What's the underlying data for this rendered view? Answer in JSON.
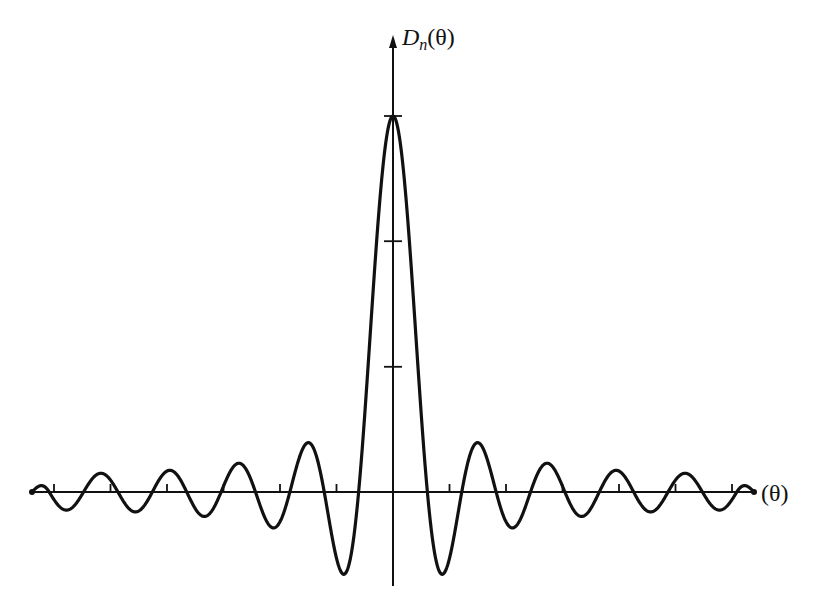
{
  "chart_data": {
    "type": "line",
    "title": "",
    "function": "D_n(theta) = sin((n + 1/2) theta) / sin(theta / 2)",
    "n": 10,
    "peak_value": 21,
    "xlabel": "(θ)",
    "ylabel": "D_n(θ)",
    "ylabel_parts": {
      "base": "D",
      "sub": "n",
      "arg": "(θ)"
    },
    "xlim": [
      -3.14159,
      3.14159
    ],
    "ylim": [
      -4.6,
      21
    ],
    "x_ticks_count_each_side": 6,
    "y_ticks_fraction_of_peak": [
      0.333,
      0.667,
      1.0
    ],
    "grid": false,
    "legend": null,
    "features": {
      "main_lobe_zeros": [
        -0.299,
        0.299
      ],
      "zero_spacing": 0.299,
      "extrema": [
        {
          "label": "central peak",
          "x": 0.0,
          "y": 21.0
        },
        {
          "label": "first min (right)",
          "x": 0.43,
          "y": -4.58
        },
        {
          "label": "first min (left)",
          "x": -0.43,
          "y": -4.58
        },
        {
          "label": "second max (right)",
          "x": 0.74,
          "y": 2.79
        },
        {
          "label": "second max (left)",
          "x": -0.74,
          "y": 2.79
        },
        {
          "label": "second min (right)",
          "x": 1.05,
          "y": -1.95
        },
        {
          "label": "second min (left)",
          "x": -1.05,
          "y": -1.95
        },
        {
          "label": "third max (right)",
          "x": 1.37,
          "y": 1.56
        },
        {
          "label": "third max (left)",
          "x": -1.37,
          "y": 1.56
        },
        {
          "label": "third min (right)",
          "x": 1.68,
          "y": -1.23
        },
        {
          "label": "third min (left)",
          "x": -1.68,
          "y": -1.23
        }
      ]
    },
    "style": {
      "line_color": "#111111",
      "axis_color": "#111111",
      "background": "#ffffff"
    }
  },
  "layout_px": {
    "origin": [
      393,
      492
    ],
    "x_half_width": 361,
    "peak_height": 376,
    "y_axis_top": 35,
    "y_axis_bottom": 586
  }
}
